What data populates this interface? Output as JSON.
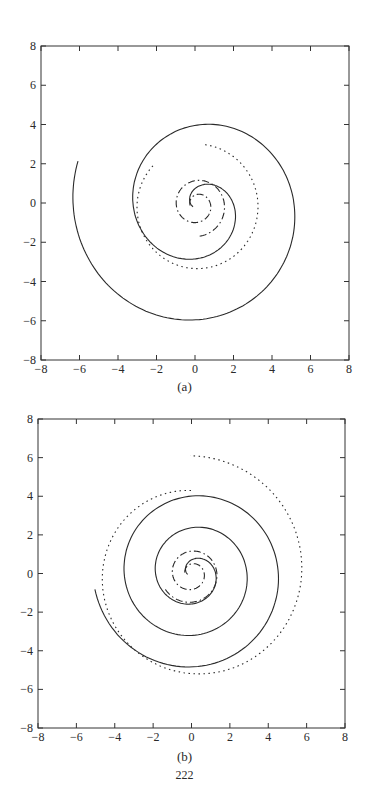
{
  "page": {
    "number": "222"
  },
  "chart_data": [
    {
      "id": "a",
      "type": "line",
      "caption": "(a)",
      "xlim": [
        -8,
        8
      ],
      "ylim": [
        -8,
        8
      ],
      "xticks": [
        -8,
        -6,
        -4,
        -2,
        0,
        2,
        4,
        6,
        8
      ],
      "yticks": [
        -8,
        -6,
        -4,
        -2,
        0,
        2,
        4,
        6,
        8
      ],
      "xtick_labels": [
        "−8",
        "−6",
        "−4",
        "−2",
        "0",
        "2",
        "4",
        "6",
        "8"
      ],
      "ytick_labels": [
        "−8",
        "−6",
        "−4",
        "−2",
        "0",
        "2",
        "4",
        "6",
        "8"
      ],
      "grid": false,
      "legend": null,
      "frame_px": {
        "left": 41,
        "top": 46,
        "right": 349,
        "bottom": 360
      },
      "series": [
        {
          "name": "solid spiral",
          "style": "solid",
          "cx": 0.2,
          "cy": -0.2,
          "r0": 0.3,
          "r1": 6.7,
          "theta0": 3.1,
          "turns": 2.05,
          "direction": -1
        },
        {
          "name": "dotted curve",
          "style": "dotted",
          "cx": 0.1,
          "cy": -0.2,
          "r0": 3.1,
          "r1": 3.2,
          "theta0": 2.4,
          "turns": 0.85,
          "direction": 1
        },
        {
          "name": "dash-dot spiral",
          "style": "dashdot",
          "cx": 0.1,
          "cy": -0.1,
          "r0": 0.35,
          "r1": 1.6,
          "theta0": 3.2,
          "turns": 1.75,
          "direction": -1
        }
      ]
    },
    {
      "id": "b",
      "type": "line",
      "caption": "(b)",
      "xlim": [
        -8,
        8
      ],
      "ylim": [
        -8,
        8
      ],
      "xticks": [
        -8,
        -6,
        -4,
        -2,
        0,
        2,
        4,
        6,
        8
      ],
      "yticks": [
        -8,
        -6,
        -4,
        -2,
        0,
        2,
        4,
        6,
        8
      ],
      "xtick_labels": [
        "−8",
        "−6",
        "−4",
        "−2",
        "0",
        "2",
        "4",
        "6",
        "8"
      ],
      "ytick_labels": [
        "−8",
        "−6",
        "−4",
        "−2",
        "0",
        "2",
        "4",
        "6",
        "8"
      ],
      "grid": false,
      "legend": null,
      "frame_px": {
        "left": 38,
        "top": 419,
        "right": 345,
        "bottom": 728
      },
      "series": [
        {
          "name": "solid spiral",
          "style": "solid",
          "cx": 0.1,
          "cy": 0.0,
          "r0": 0.3,
          "r1": 5.2,
          "theta0": 3.3,
          "turns": 3.0,
          "direction": -1
        },
        {
          "name": "dotted spiral",
          "style": "dotted",
          "cx": 0.1,
          "cy": 0.0,
          "r0": 4.3,
          "r1": 6.1,
          "theta0": 1.6,
          "turns": 1.0,
          "direction": 1
        },
        {
          "name": "dash-dot spiral",
          "style": "dashdot",
          "cx": 0.0,
          "cy": 0.0,
          "r0": 0.35,
          "r1": 1.6,
          "theta0": 3.0,
          "turns": 1.9,
          "direction": -1
        }
      ]
    }
  ]
}
